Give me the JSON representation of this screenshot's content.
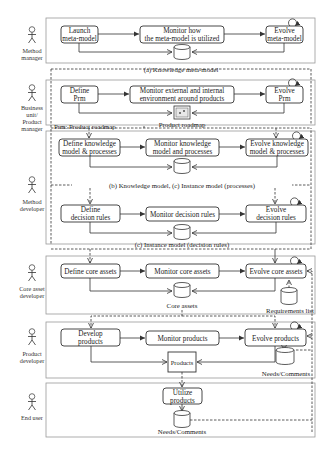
{
  "actors": [
    {
      "id": "method-manager",
      "lines": [
        "Method",
        "manager"
      ]
    },
    {
      "id": "business-unit",
      "lines": [
        "Business",
        "unit/",
        "Product",
        "manager"
      ]
    },
    {
      "id": "method-developer",
      "lines": [
        "Method",
        "developer"
      ]
    },
    {
      "id": "core-asset-developer",
      "lines": [
        "Core asset",
        "developer"
      ]
    },
    {
      "id": "product-developer",
      "lines": [
        "Product",
        "developer"
      ]
    },
    {
      "id": "end-user",
      "lines": [
        "End user"
      ]
    }
  ],
  "lanes": {
    "meta_model": {
      "boxes": [
        {
          "lines": [
            "Launch",
            "meta-model"
          ]
        },
        {
          "lines": [
            "Monitor how",
            "the meta-model is utilized"
          ]
        },
        {
          "lines": [
            "Evolve",
            "meta-model"
          ]
        }
      ],
      "caption": "(a) Knowledge meta-model"
    },
    "roadmap": {
      "boxes": [
        {
          "lines": [
            "Define",
            "Prm"
          ]
        },
        {
          "lines": [
            "Monitor external and internal",
            "environment around products"
          ]
        },
        {
          "lines": [
            "Evolve",
            "Prm"
          ]
        }
      ],
      "store_label": "Product roadmap",
      "note": "Prm: Product roadmap"
    },
    "knowledge_model": {
      "boxes": [
        {
          "lines": [
            "Define knowledge",
            "model & processes"
          ]
        },
        {
          "lines": [
            "Monitor knowledge",
            "model and processes"
          ]
        },
        {
          "lines": [
            "Evolve knowledge",
            "model & processes"
          ]
        }
      ],
      "caption": "(b) Knowledge model, (c) Instance model (processes)"
    },
    "decision_rules": {
      "boxes": [
        {
          "lines": [
            "Define",
            "decision rules"
          ]
        },
        {
          "lines": [
            "Monitor decision rules"
          ]
        },
        {
          "lines": [
            "Evolve",
            "decision rules"
          ]
        }
      ],
      "caption": "(c) Instance model (decision rules)"
    },
    "core_assets": {
      "boxes": [
        {
          "lines": [
            "Define core assets"
          ]
        },
        {
          "lines": [
            "Monitor core assets"
          ]
        },
        {
          "lines": [
            "Evolve core assets"
          ]
        }
      ],
      "store_label": "Core assets",
      "req_label": "Requirements list"
    },
    "products": {
      "boxes": [
        {
          "lines": [
            "Develop",
            "products"
          ]
        },
        {
          "lines": [
            "Monitor products"
          ]
        },
        {
          "lines": [
            "Evolve products"
          ]
        }
      ],
      "product_box": "Products",
      "needs_label": "Needs/Comments"
    },
    "end_user": {
      "box": {
        "lines": [
          "Utilize",
          "products"
        ]
      },
      "needs_label": "Needs/Comments"
    }
  }
}
